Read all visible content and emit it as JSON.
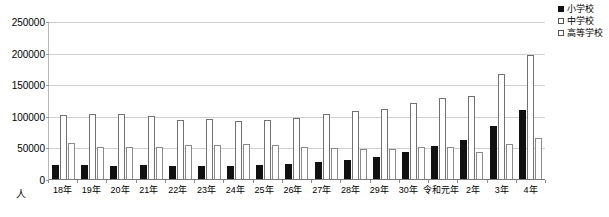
{
  "chart_data": {
    "type": "bar",
    "title": "",
    "xlabel": "",
    "ylabel": "人",
    "ylim": [
      0,
      250000
    ],
    "yticks": [
      0,
      50000,
      100000,
      150000,
      200000,
      250000
    ],
    "ytick_labels": [
      "0",
      "50000",
      "100000",
      "150000",
      "200000",
      "250000"
    ],
    "grid": true,
    "legend_position": "top-right",
    "categories": [
      "18年",
      "19年",
      "20年",
      "21年",
      "22年",
      "23年",
      "24年",
      "25年",
      "26年",
      "27年",
      "28年",
      "29年",
      "30年",
      "令和元年",
      "2年",
      "3年",
      "4年"
    ],
    "series": [
      {
        "name": "小学校",
        "color": "#111111",
        "fill": "solid",
        "values": [
          23000,
          23000,
          22500,
          23000,
          22500,
          22000,
          21500,
          23000,
          26000,
          28000,
          31000,
          36000,
          45000,
          54000,
          64000,
          85000,
          110000
        ]
      },
      {
        "name": "中学校",
        "color": "#ffffff",
        "fill": "open",
        "values": [
          103000,
          104000,
          105000,
          101000,
          95000,
          96000,
          94000,
          95000,
          98000,
          104000,
          109000,
          113000,
          122000,
          129000,
          133000,
          167000,
          198000
        ]
      },
      {
        "name": "高等学校",
        "color": "#ffffff",
        "fill": "open",
        "values": [
          58000,
          53000,
          53000,
          52000,
          56000,
          56000,
          57000,
          56000,
          53000,
          50000,
          49000,
          49000,
          53000,
          53000,
          44000,
          57000,
          67000
        ]
      }
    ]
  },
  "legend": {
    "items": [
      {
        "label": "小学校",
        "swatch": "filled-square-icon"
      },
      {
        "label": "中学校",
        "swatch": "open-square-icon"
      },
      {
        "label": "高等学校",
        "swatch": "open-square-icon"
      }
    ]
  },
  "axis": {
    "unit": "人"
  }
}
